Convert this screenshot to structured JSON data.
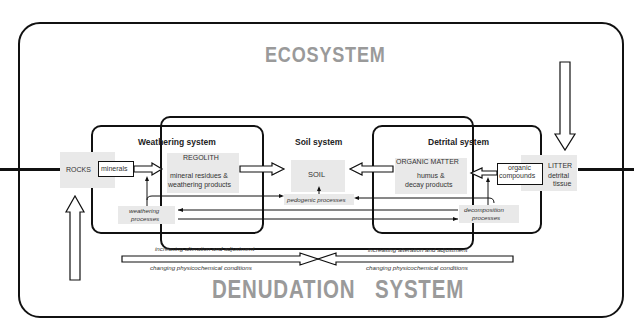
{
  "titles": {
    "ecosystem": "ECOSYSTEM",
    "denudation": "DENUDATION   SYSTEM"
  },
  "systems": {
    "weathering": {
      "title": "Weathering system"
    },
    "soil": {
      "title": "Soil system"
    },
    "detrital": {
      "title": "Detrital system"
    }
  },
  "nodes": {
    "rocks": "ROCKS",
    "minerals": "minerals",
    "regolith_title": "REGOLITH",
    "regolith_line1": "mineral residues &",
    "regolith_line2": "weathering products",
    "soil": "SOIL",
    "organic_matter_title": "ORGANIC MATTER",
    "organic_line1": "humus &",
    "organic_line2": "decay products",
    "organic_compounds_line1": "organic",
    "organic_compounds_line2": "compounds",
    "litter_title": "LITTER",
    "litter_line1": "detrital",
    "litter_line2": "tissue"
  },
  "processes": {
    "weathering_line1": "weathering",
    "weathering_line2": "processes",
    "pedogenic": "pedogenic processes",
    "decomposition_line1": "decomposition",
    "decomposition_line2": "processes"
  },
  "gradients": {
    "left_top": "increasing alteration and adjustment",
    "left_bottom": "changing physicochemical conditions",
    "right_top": "increasing alteration and adjustment",
    "right_bottom": "changing physicochemical conditions"
  }
}
